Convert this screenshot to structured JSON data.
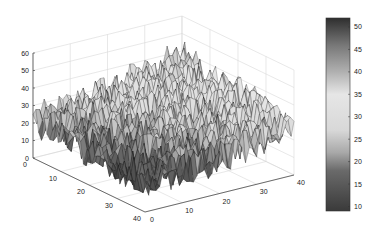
{
  "chart_data": {
    "type": "surface3d",
    "title": "",
    "xlabel": "",
    "ylabel": "",
    "zlabel": "",
    "grid": true,
    "x_range": [
      0,
      40
    ],
    "y_range": [
      0,
      40
    ],
    "z_range": [
      0,
      60
    ],
    "x_ticks": [
      "0",
      "10",
      "20",
      "30",
      "40"
    ],
    "y_ticks": [
      "0",
      "10",
      "20",
      "30",
      "40"
    ],
    "z_ticks": [
      "0",
      "10",
      "20",
      "30",
      "40",
      "50",
      "60"
    ],
    "surface": {
      "grid_size": 40,
      "description": "Noisy surface; low near x=0..40,y=high corner (z~10-15), rising toward far edge (z~25-40), mean tilt increasing along x",
      "z_min": 9,
      "z_max": 52,
      "corner_means": {
        "x0_y0": 22,
        "x40_y0": 38,
        "x0_y40": 12,
        "x40_y40": 28
      },
      "noise_amplitude": 9
    },
    "colorbar": {
      "ticks": [
        "10",
        "15",
        "20",
        "25",
        "30",
        "35",
        "40",
        "45",
        "50"
      ],
      "range": [
        9,
        52
      ],
      "colormap_stops": [
        {
          "value": 9,
          "color": "#3a3a3a"
        },
        {
          "value": 18,
          "color": "#6a6a6a"
        },
        {
          "value": 22,
          "color": "#a8a8a8"
        },
        {
          "value": 27,
          "color": "#d8d8d8"
        },
        {
          "value": 35,
          "color": "#e6e6e6"
        },
        {
          "value": 40,
          "color": "#b0b0b0"
        },
        {
          "value": 46,
          "color": "#777777"
        },
        {
          "value": 52,
          "color": "#2e2e2e"
        }
      ],
      "placement": "right"
    }
  }
}
